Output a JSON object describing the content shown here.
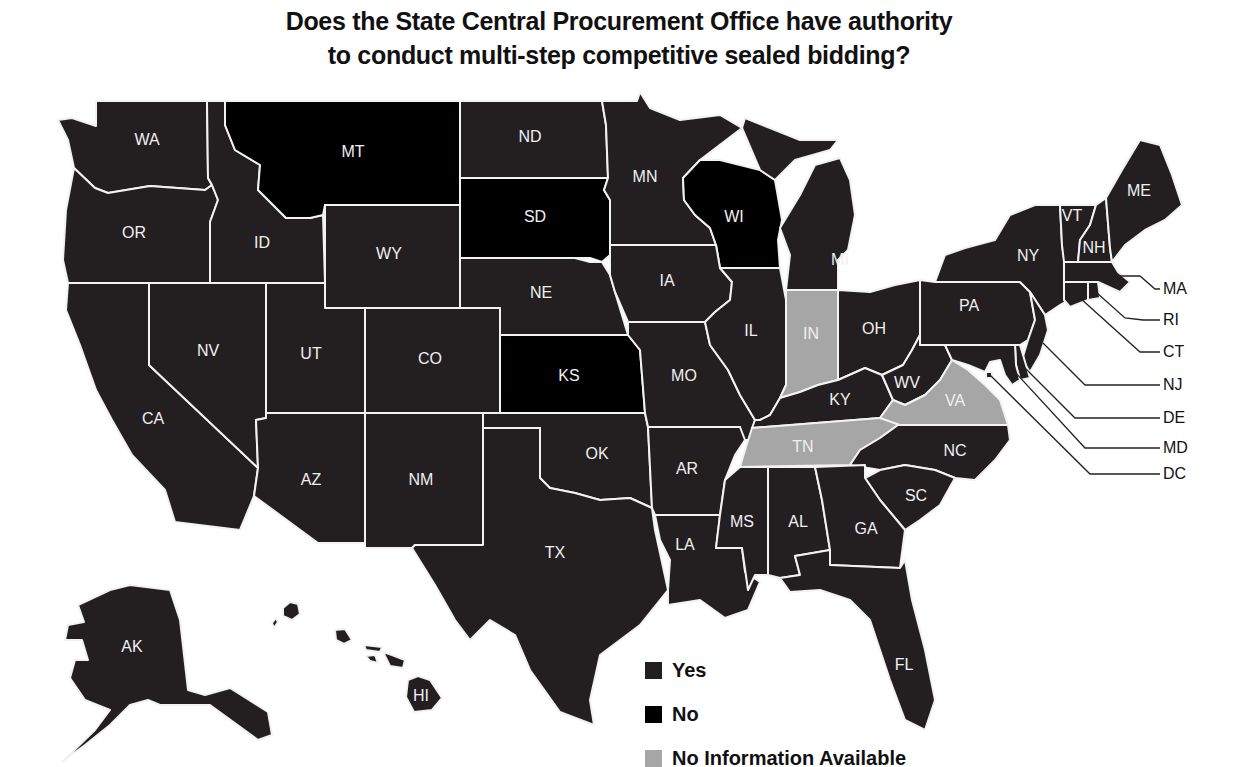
{
  "title": {
    "line1": "Does the State Central Procurement Office have authority",
    "line2": "to conduct multi-step competitive sealed bidding?"
  },
  "colors": {
    "yes": "#231f20",
    "no": "#000000",
    "no_info": "#a6a6a6",
    "border": "#f2f2f2"
  },
  "legend": [
    {
      "key": "yes",
      "label": "Yes",
      "color": "#231f20"
    },
    {
      "key": "no",
      "label": "No",
      "color": "#000000"
    },
    {
      "key": "no_info",
      "label": "No Information Available",
      "color": "#a6a6a6"
    }
  ],
  "states": {
    "WA": "yes",
    "OR": "yes",
    "CA": "yes",
    "ID": "yes",
    "NV": "yes",
    "MT": "no",
    "WY": "yes",
    "UT": "yes",
    "AZ": "yes",
    "CO": "yes",
    "NM": "yes",
    "ND": "yes",
    "SD": "no",
    "NE": "yes",
    "KS": "no",
    "OK": "yes",
    "TX": "yes",
    "MN": "yes",
    "IA": "yes",
    "MO": "yes",
    "AR": "yes",
    "LA": "yes",
    "WI": "no",
    "IL": "yes",
    "MI": "yes",
    "IN": "no_info",
    "OH": "yes",
    "KY": "yes",
    "TN": "no_info",
    "MS": "yes",
    "AL": "yes",
    "GA": "yes",
    "FL": "yes",
    "SC": "yes",
    "NC": "yes",
    "VA": "no_info",
    "WV": "yes",
    "PA": "yes",
    "NY": "yes",
    "VT": "yes",
    "NH": "yes",
    "ME": "yes",
    "MA": "yes",
    "RI": "yes",
    "CT": "yes",
    "NJ": "yes",
    "DE": "yes",
    "MD": "yes",
    "DC": "yes",
    "AK": "yes",
    "HI": "yes"
  },
  "labels": {
    "WA": "WA",
    "OR": "OR",
    "CA": "CA",
    "ID": "ID",
    "NV": "NV",
    "MT": "MT",
    "WY": "WY",
    "UT": "UT",
    "AZ": "AZ",
    "CO": "CO",
    "NM": "NM",
    "ND": "ND",
    "SD": "SD",
    "NE": "NE",
    "KS": "KS",
    "OK": "OK",
    "TX": "TX",
    "MN": "MN",
    "IA": "IA",
    "MO": "MO",
    "AR": "AR",
    "LA": "LA",
    "WI": "WI",
    "IL": "IL",
    "MI": "MI",
    "IN": "IN",
    "OH": "OH",
    "KY": "KY",
    "TN": "TN",
    "MS": "MS",
    "AL": "AL",
    "GA": "GA",
    "FL": "FL",
    "SC": "SC",
    "NC": "NC",
    "VA": "VA",
    "WV": "WV",
    "PA": "PA",
    "NY": "NY",
    "VT": "VT",
    "NH": "NH",
    "ME": "ME",
    "AK": "AK",
    "HI": "HI"
  },
  "callouts": {
    "MA": "MA",
    "RI": "RI",
    "CT": "CT",
    "NJ": "NJ",
    "DE": "DE",
    "MD": "MD",
    "DC": "DC"
  }
}
